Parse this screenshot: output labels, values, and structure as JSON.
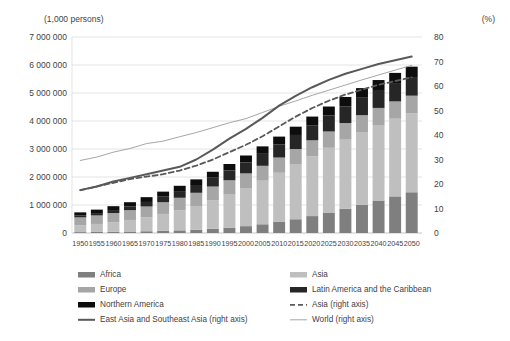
{
  "chart_data": {
    "type": "bar",
    "title": "",
    "subtitle": "",
    "left_axis_label": "(1,000 persons)",
    "right_axis_label": "(%)",
    "xlabel": "",
    "ylabel": "",
    "grid": true,
    "legend_position": "bottom",
    "categories": [
      "1950",
      "1955",
      "1960",
      "1965",
      "1970",
      "1975",
      "1980",
      "1985",
      "1990",
      "1995",
      "2000",
      "2005",
      "2010",
      "2015",
      "2020",
      "2025",
      "2030",
      "2035",
      "2040",
      "2045",
      "2050"
    ],
    "left_ylim": [
      0,
      7000000
    ],
    "left_ticks": [
      "0",
      "1 000 000",
      "2 000 000",
      "3 000 000",
      "4 000 000",
      "5 000 000",
      "6 000 000",
      "7 000 000"
    ],
    "left_tick_values": [
      0,
      1000000,
      2000000,
      3000000,
      4000000,
      5000000,
      6000000,
      7000000
    ],
    "right_ylim": [
      0,
      80
    ],
    "right_ticks": [
      "0",
      "10",
      "20",
      "30",
      "40",
      "50",
      "60",
      "70",
      "80"
    ],
    "right_tick_values": [
      0,
      10,
      20,
      30,
      40,
      50,
      60,
      70,
      80
    ],
    "stacked": true,
    "series": [
      {
        "name": "Africa",
        "axis": "left",
        "color": "#7f7f7f",
        "values": [
          32000,
          38000,
          45000,
          53000,
          63000,
          77000,
          95000,
          119000,
          151000,
          193000,
          245000,
          311000,
          395000,
          491000,
          604000,
          731000,
          868000,
          1012000,
          1160000,
          1308000,
          1455000
        ]
      },
      {
        "name": "Asia",
        "axis": "left",
        "color": "#bfbfbf",
        "values": [
          245000,
          285000,
          342000,
          413000,
          501000,
          604000,
          716000,
          846000,
          1012000,
          1178000,
          1361000,
          1558000,
          1756000,
          1951000,
          2137000,
          2312000,
          2466000,
          2594000,
          2697000,
          2774000,
          2826000
        ]
      },
      {
        "name": "Europe",
        "axis": "left",
        "color": "#a6a6a6",
        "values": [
          281000,
          304000,
          327000,
          351000,
          383000,
          418000,
          447000,
          471000,
          496000,
          513000,
          523000,
          531000,
          544000,
          557000,
          570000,
          582000,
          593000,
          602000,
          610000,
          617000,
          623000
        ]
      },
      {
        "name": "Latin America and the Caribbean",
        "axis": "left",
        "color": "#262626",
        "values": [
          69000,
          84000,
          105000,
          129000,
          162000,
          198000,
          238000,
          278000,
          314000,
          350000,
          390000,
          428000,
          466000,
          502000,
          538000,
          570000,
          598000,
          622000,
          641000,
          656000,
          666000
        ]
      },
      {
        "name": "Northern America",
        "axis": "left",
        "color": "#0d0d0d",
        "values": [
          110000,
          124000,
          139000,
          154000,
          171000,
          180000,
          190000,
          201000,
          214000,
          230000,
          249000,
          266000,
          282000,
          296000,
          309000,
          322000,
          334000,
          345000,
          355000,
          363000,
          371000
        ]
      },
      {
        "name": "East Asia and Southeast Asia (right axis)",
        "axis": "right",
        "color": "#595959",
        "style": "solid",
        "width": 2.0,
        "values": [
          17.5,
          19.0,
          21.0,
          22.5,
          24.0,
          25.5,
          27.0,
          30.0,
          34.0,
          38.5,
          42.5,
          47.0,
          52.0,
          56.0,
          59.5,
          62.5,
          65.0,
          67.0,
          69.0,
          70.5,
          72.0
        ]
      },
      {
        "name": "Asia (right axis)",
        "axis": "right",
        "color": "#595959",
        "style": "dashed",
        "width": 1.8,
        "values": [
          17.5,
          19.0,
          20.5,
          22.0,
          23.0,
          24.0,
          25.5,
          27.5,
          30.0,
          33.0,
          36.0,
          39.5,
          43.5,
          47.5,
          51.0,
          54.0,
          56.5,
          58.5,
          60.5,
          62.0,
          63.5
        ]
      },
      {
        "name": "World (right axis)",
        "axis": "right",
        "color": "#a6a6a6",
        "style": "solid",
        "width": 1.0,
        "values": [
          29.6,
          31.0,
          33.0,
          34.5,
          36.5,
          37.5,
          39.3,
          41.0,
          43.0,
          45.0,
          46.7,
          49.2,
          51.7,
          53.9,
          56.2,
          58.3,
          60.4,
          62.5,
          64.5,
          66.5,
          68.4
        ]
      }
    ],
    "legend": [
      {
        "label": "Africa",
        "marker": "swatch",
        "color": "#7f7f7f"
      },
      {
        "label": "Asia",
        "marker": "swatch",
        "color": "#bfbfbf"
      },
      {
        "label": "Europe",
        "marker": "swatch",
        "color": "#a6a6a6"
      },
      {
        "label": "Latin America and the Caribbean",
        "marker": "swatch",
        "color": "#262626"
      },
      {
        "label": "Northern America",
        "marker": "swatch",
        "color": "#0d0d0d"
      },
      {
        "label": "Asia (right axis)",
        "marker": "dashed-line",
        "color": "#595959"
      },
      {
        "label": "East Asia and Southeast Asia (right axis)",
        "marker": "solid-line-thick",
        "color": "#595959"
      },
      {
        "label": "World (right axis)",
        "marker": "solid-line-thin",
        "color": "#a6a6a6"
      }
    ]
  }
}
